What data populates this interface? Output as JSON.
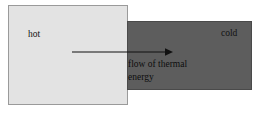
{
  "diagram": {
    "hot_block": {
      "label": "hot",
      "color": "#e3e3e3",
      "border_color": "#9a9a9a"
    },
    "cold_block": {
      "label": "cold",
      "color": "#5d5d5d",
      "border_color": "#4a4a4a"
    },
    "arrow": {
      "name": "flow-arrow",
      "direction": "left-to-right",
      "color": "#111111"
    },
    "caption": {
      "line1": "flow of thermal",
      "line2": "energy"
    },
    "background": "#ffffff"
  }
}
